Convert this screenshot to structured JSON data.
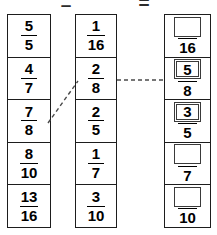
{
  "operators": {
    "minus": "–",
    "equals": "="
  },
  "columns": {
    "minuend": {
      "cells": [
        {
          "numerator": "5",
          "denominator": "5"
        },
        {
          "numerator": "4",
          "denominator": "7"
        },
        {
          "numerator": "7",
          "denominator": "8"
        },
        {
          "numerator": "8",
          "denominator": "10"
        },
        {
          "numerator": "13",
          "denominator": "16"
        }
      ]
    },
    "subtrahend": {
      "cells": [
        {
          "numerator": "1",
          "denominator": "16"
        },
        {
          "numerator": "2",
          "denominator": "8"
        },
        {
          "numerator": "2",
          "denominator": "5"
        },
        {
          "numerator": "1",
          "denominator": "7"
        },
        {
          "numerator": "3",
          "denominator": "10"
        }
      ]
    },
    "answer": {
      "cells": [
        {
          "value": "",
          "denominator": "16",
          "filled": false
        },
        {
          "value": "5",
          "denominator": "8",
          "filled": true
        },
        {
          "value": "3",
          "denominator": "5",
          "filled": true
        },
        {
          "value": "",
          "denominator": "7",
          "filled": false
        },
        {
          "value": "",
          "denominator": "10",
          "filled": false
        }
      ]
    }
  },
  "connectors": {
    "diagonal": {
      "x1": 48,
      "y1": 123,
      "x2": 78,
      "y2": 81
    },
    "horizontal": {
      "x1": 117,
      "y1": 80,
      "x2": 164,
      "y2": 80
    },
    "color": "#4a4a4a"
  }
}
